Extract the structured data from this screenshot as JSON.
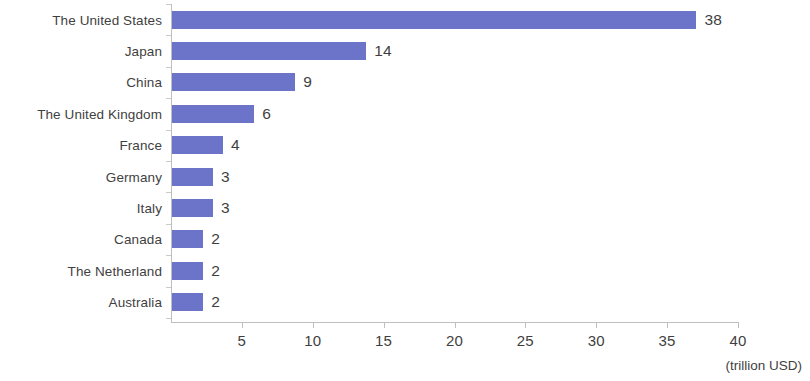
{
  "chart_data": {
    "type": "bar",
    "orientation": "horizontal",
    "title": "",
    "subtitle": "",
    "xlabel": "(trillion USD)",
    "ylabel": "",
    "categories": [
      "The United States",
      "Japan",
      "China",
      "The United Kingdom",
      "France",
      "Germany",
      "Italy",
      "Canada",
      "The Netherland",
      "Australia"
    ],
    "values": [
      38,
      14,
      9,
      6,
      4,
      3,
      3,
      2,
      2,
      2
    ],
    "bar_pixel_values": [
      37.0,
      13.7,
      8.7,
      5.8,
      3.6,
      2.9,
      2.9,
      2.2,
      2.2,
      2.2
    ],
    "data_labels": [
      "38",
      "14",
      "9",
      "6",
      "4",
      "3",
      "3",
      "2",
      "2",
      "2"
    ],
    "xlim": [
      0,
      40
    ],
    "x_ticks": [
      5,
      10,
      15,
      20,
      25,
      30,
      35,
      40
    ],
    "x_tick_labels": [
      "5",
      "10",
      "15",
      "20",
      "25",
      "30",
      "35",
      "40"
    ],
    "grid": false,
    "legend": null,
    "legend_position": "none",
    "series": [
      {
        "name": "",
        "color": "#6b74c8",
        "values": [
          38,
          14,
          9,
          6,
          4,
          3,
          3,
          2,
          2,
          2
        ]
      }
    ]
  },
  "colors": {
    "bar": "#6b74c8",
    "text": "#3f3f3f",
    "axis": "#bfbfbf",
    "tick": "#c9c9c9",
    "background": "#ffffff"
  }
}
